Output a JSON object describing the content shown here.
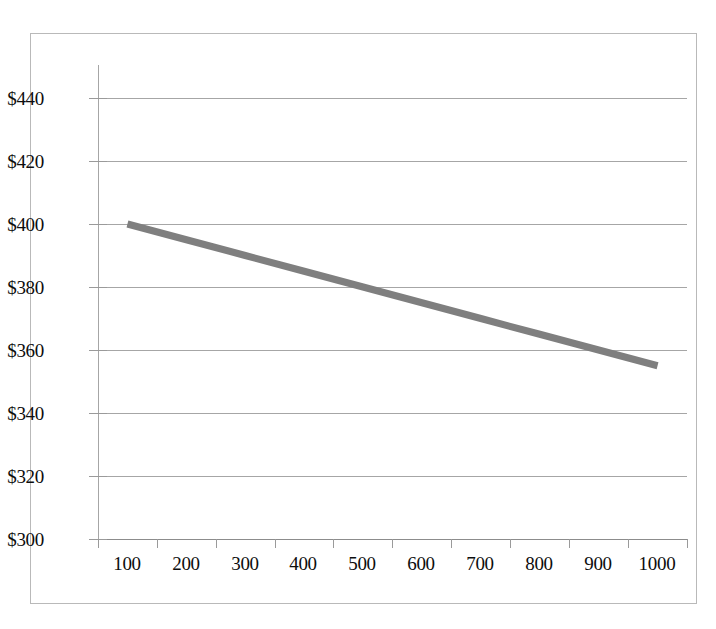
{
  "chart_data": {
    "type": "line",
    "title": "",
    "subtitle": "",
    "xlabel": "",
    "ylabel": "",
    "categories": [
      "100",
      "200",
      "300",
      "400",
      "500",
      "600",
      "700",
      "800",
      "900",
      "1000"
    ],
    "x": [
      100,
      200,
      300,
      400,
      500,
      600,
      700,
      800,
      900,
      1000
    ],
    "series": [
      {
        "name": "",
        "color": "#7f7f7f",
        "line_width": 7,
        "values": [
          400,
          395,
          390,
          385,
          380,
          375,
          370,
          365,
          360,
          355
        ]
      }
    ],
    "ylim": [
      300,
      440
    ],
    "ytick_values": [
      300,
      320,
      340,
      360,
      380,
      400,
      420,
      440
    ],
    "ytick_labels": [
      "$300",
      "$320",
      "$340",
      "$360",
      "$380",
      "$400",
      "$420",
      "$440"
    ],
    "xtick_labels": [
      "100",
      "200",
      "300",
      "400",
      "500",
      "600",
      "700",
      "800",
      "900",
      "1000"
    ],
    "grid": {
      "horizontal": true,
      "vertical": false,
      "color": "#a6a6a6"
    },
    "legend": {
      "visible": false,
      "position": "none",
      "entries": []
    },
    "axis": {
      "y_axis_line_color": "#a6a6a6",
      "x_axis_line_color": "#8c8c8c",
      "tick_color": "#9a9a9a",
      "label_color": "#0d0d0d"
    },
    "frame": {
      "border_color": "#b9b9b9",
      "background_color": "#ffffff"
    }
  }
}
